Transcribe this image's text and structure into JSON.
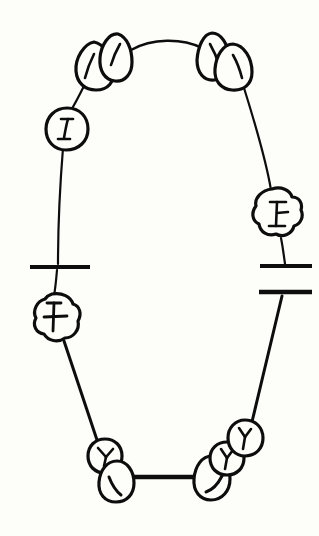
{
  "chart": {
    "notation": "dental-arch-diagram",
    "background_color": "#fdfdf9",
    "ink_color": "#0d0d0d",
    "width": 319,
    "height": 536
  },
  "legend": {
    "tooth_shape_teardrop": "incisor",
    "tooth_shape_round": "premolar",
    "tooth_shape_lobed": "molar",
    "mark_I": "I-shaped fissure",
    "mark_Y": "Y-shaped fissure",
    "mark_cross": "cross-shaped fissure",
    "mark_curve": "curved surface mark",
    "bar": "edentulous-span-bar"
  },
  "upper_arch": {
    "label": "upper arch",
    "midline_connector": "thin arc",
    "teeth": [
      {
        "id": "upper-left-molar",
        "shape": "round",
        "mark": "I",
        "side": "left",
        "position": "posterior",
        "cx": 67,
        "cy": 128
      },
      {
        "id": "upper-left-lateral-incisor",
        "shape": "teardrop",
        "mark": "curve",
        "side": "left",
        "position": "anterior",
        "cx": 99,
        "cy": 68
      },
      {
        "id": "upper-left-central-incisor",
        "shape": "teardrop",
        "mark": "curve",
        "side": "left",
        "position": "anterior",
        "cx": 117,
        "cy": 56
      },
      {
        "id": "upper-right-central-incisor",
        "shape": "teardrop",
        "mark": "curve",
        "side": "right",
        "position": "anterior",
        "cx": 213,
        "cy": 55
      },
      {
        "id": "upper-right-lateral-incisor",
        "shape": "teardrop",
        "mark": "curve",
        "side": "right",
        "position": "anterior",
        "cx": 232,
        "cy": 68
      },
      {
        "id": "upper-right-molar",
        "shape": "lobed",
        "mark": "I",
        "side": "right",
        "position": "posterior",
        "cx": 277,
        "cy": 212
      }
    ]
  },
  "lower_arch": {
    "label": "lower arch",
    "midline_connector": "thick bar",
    "teeth": [
      {
        "id": "lower-left-molar",
        "shape": "lobed",
        "mark": "cross",
        "side": "left",
        "position": "posterior",
        "cx": 54,
        "cy": 317
      },
      {
        "id": "lower-left-premolar",
        "shape": "round",
        "mark": "Y",
        "side": "left",
        "position": "middle",
        "cx": 105,
        "cy": 456
      },
      {
        "id": "lower-left-central-incisor",
        "shape": "teardrop",
        "mark": "curve",
        "side": "left",
        "position": "anterior",
        "cx": 117,
        "cy": 482
      },
      {
        "id": "lower-right-central-incisor",
        "shape": "teardrop",
        "mark": "curve",
        "side": "right",
        "position": "anterior",
        "cx": 214,
        "cy": 479
      },
      {
        "id": "lower-right-premolar",
        "shape": "round",
        "mark": "Y",
        "side": "right",
        "position": "middle",
        "cx": 227,
        "cy": 458
      },
      {
        "id": "lower-right-second-premolar",
        "shape": "round",
        "mark": "Y",
        "side": "right",
        "position": "middle",
        "cx": 245,
        "cy": 437
      }
    ]
  },
  "edentulous_bars": [
    {
      "id": "left-bar-upper",
      "side": "left",
      "x1": 30,
      "x2": 90,
      "y": 267,
      "thickness": 4
    },
    {
      "id": "right-bar-upper",
      "side": "right",
      "x1": 260,
      "x2": 312,
      "y": 266,
      "thickness": 4
    },
    {
      "id": "right-bar-lower",
      "side": "right",
      "x1": 259,
      "x2": 312,
      "y": 292,
      "thickness": 4
    }
  ],
  "bridge_bars": [
    {
      "id": "lower-midline-bridge",
      "x1": 133,
      "x2": 201,
      "y": 477,
      "thickness": 4
    }
  ]
}
